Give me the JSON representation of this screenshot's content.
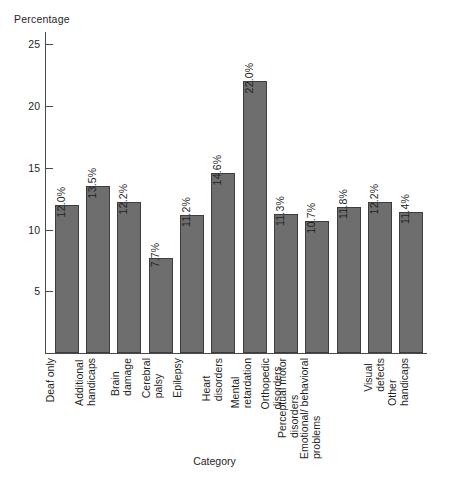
{
  "chart_data": {
    "type": "bar",
    "title": "",
    "xlabel": "Category",
    "ylabel": "Percentage",
    "ylim": [
      0,
      26
    ],
    "yticks": [
      5,
      10,
      15,
      20,
      25
    ],
    "grid": false,
    "legend": null,
    "bar_color": "#6e6e6e",
    "bar_border_color": "#3d3d3d",
    "axis_color": "#4a4a4a",
    "value_label_suffix": "%",
    "categories": [
      "Deaf only",
      "Additional handicaps",
      "Brain damage",
      "Cerebral palsy",
      "Epilepsy",
      "Heart disorders",
      "Mental retardation",
      "Orthopedic disorders",
      "Perceptual motor disorders",
      "Emotional/ behavioral problems",
      "Visual defects",
      "Other handicaps"
    ],
    "category_lines": [
      [
        "Deaf only"
      ],
      [
        "Additional",
        "handicaps"
      ],
      [
        "Brain",
        "damage"
      ],
      [
        "Cerebral",
        "palsy"
      ],
      [
        "Epilepsy"
      ],
      [
        "Heart",
        "disorders"
      ],
      [
        "Mental",
        "retardation"
      ],
      [
        "Orthopedic",
        "disorders"
      ],
      [
        "Perceptual motor",
        "disorders"
      ],
      [
        "Emotional/ behavioral",
        "problems"
      ],
      [
        "Visual",
        "defects"
      ],
      [
        "Other",
        "handicaps"
      ]
    ],
    "values": [
      12.0,
      13.5,
      12.2,
      7.7,
      11.2,
      14.6,
      22.0,
      11.3,
      10.7,
      11.8,
      12.2,
      11.4
    ],
    "value_labels": [
      "12.0%",
      "13.5%",
      "12.2%",
      "7.7%",
      "11.2%",
      "14.6%",
      "22.0%",
      "11.3%",
      "10.7%",
      "11.8%",
      "12.2%",
      "11.4%"
    ]
  },
  "axes": {
    "y_title": "Percentage",
    "x_title": "Category",
    "y_tick_labels": [
      "25",
      "20",
      "15",
      "10",
      "5"
    ]
  }
}
